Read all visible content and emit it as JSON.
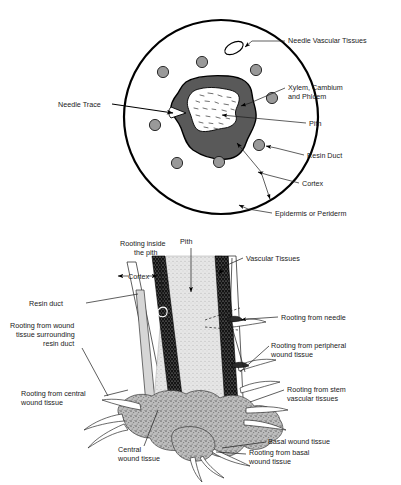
{
  "figure": {
    "panels": [
      {
        "id": "cross-section",
        "name": "Needle fascicle cross section"
      },
      {
        "id": "longitudinal-section",
        "name": "Rooted cutting longitudinal section"
      }
    ]
  },
  "top_panel": {
    "labels": {
      "needle_vascular_tissues": "Needle Vascular Tissues",
      "xylem_cambium_phloem_line1": "Xylem, Cambium",
      "xylem_cambium_phloem_line2": "and Phloem",
      "pith": "Pith",
      "resin_duct": "Resin Duct",
      "cortex": "Cortex",
      "epidermis_or_periderm": "Epidermis or Periderm",
      "needle_trace": "Needle Trace"
    }
  },
  "bottom_panel": {
    "labels": {
      "rooting_inside_pith_line1": "Rooting inside",
      "rooting_inside_pith_line2": "the pith",
      "pith": "Pith",
      "vascular_tissues": "Vascular Tissues",
      "cortex": "Cortex",
      "resin_duct": "Resin duct",
      "rooting_from_wound_resin_line1": "Rooting from wound",
      "rooting_from_wound_resin_line2": "tissue surrounding",
      "rooting_from_wound_resin_line3": "resin duct",
      "rooting_from_central_line1": "Rooting from central",
      "rooting_from_central_line2": "wound tissue",
      "rooting_from_needle": "Rooting from needle",
      "rooting_from_peripheral_line1": "Rooting from peripheral",
      "rooting_from_peripheral_line2": "wound tissue",
      "rooting_from_stem_line1": "Rooting from stem",
      "rooting_from_stem_line2": "vascular tissues",
      "central_wound_tissue_line1": "Central",
      "central_wound_tissue_line2": "wound tissue",
      "basal_wound_tissue": "Basal wound tissue",
      "rooting_from_basal_line1": "Rooting from basal",
      "rooting_from_basal_line2": "wound tissue"
    }
  },
  "colors": {
    "background": "#ffffff",
    "outline": "#000000",
    "vascular_ring_fill": "#595959",
    "resin_duct_fill": "#999999",
    "pith_fill": "#ffffff",
    "stem_pith_fill": "#ebebeb",
    "stem_vascular_fill": "#141414",
    "wound_tissue_fill": "#a8a8a8",
    "text": "#1a1a1a"
  }
}
